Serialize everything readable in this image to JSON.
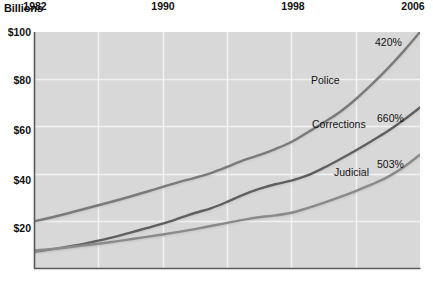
{
  "chart_data": {
    "type": "line",
    "title": "Billions",
    "xlabel": "",
    "ylabel": "Billions",
    "grid": true,
    "legend_position": "inline-labels",
    "xlim": [
      1982,
      2006
    ],
    "ylim": [
      0,
      100
    ],
    "x_ticks": [
      {
        "value": 1982,
        "label": "1982"
      },
      {
        "value": 1990,
        "label": "1990"
      },
      {
        "value": 1998,
        "label": "1998"
      },
      {
        "value": 2006,
        "label": "2006"
      }
    ],
    "y_ticks": [
      {
        "value": 20,
        "label": "$20"
      },
      {
        "value": 40,
        "label": "$40"
      },
      {
        "value": 60,
        "label": "$60"
      },
      {
        "value": 80,
        "label": "$80"
      },
      {
        "value": 100,
        "label": "$100"
      }
    ],
    "x": [
      1982,
      1983,
      1984,
      1985,
      1986,
      1987,
      1988,
      1989,
      1990,
      1991,
      1992,
      1993,
      1994,
      1995,
      1996,
      1997,
      1998,
      1999,
      2000,
      2001,
      2002,
      2003,
      2004,
      2005,
      2006
    ],
    "series": [
      {
        "name": "Police",
        "annotation": "420%",
        "color": "#7a7a7a",
        "values": [
          19.8,
          21.3,
          23.0,
          24.8,
          26.6,
          28.4,
          30.3,
          32.3,
          34.4,
          36.4,
          38.2,
          40.2,
          42.8,
          45.6,
          47.8,
          50.4,
          53.4,
          57.4,
          61.6,
          66.0,
          71.5,
          77.8,
          84.6,
          92.0,
          100.0
        ]
      },
      {
        "name": "Corrections",
        "annotation": "660%",
        "color": "#5e5e5e",
        "values": [
          6.9,
          7.8,
          8.9,
          10.1,
          11.6,
          13.2,
          15.0,
          16.9,
          18.8,
          21.0,
          23.3,
          25.3,
          28.0,
          31.0,
          33.5,
          35.5,
          37.0,
          39.2,
          42.4,
          46.0,
          49.8,
          53.8,
          58.0,
          62.8,
          68.0
        ]
      },
      {
        "name": "Judicial",
        "annotation": "503%",
        "color": "#8a8a8a",
        "values": [
          7.4,
          8.0,
          8.7,
          9.5,
          10.3,
          11.2,
          12.2,
          13.2,
          14.2,
          15.3,
          16.5,
          17.8,
          19.1,
          20.4,
          21.5,
          22.3,
          23.4,
          25.4,
          27.6,
          30.0,
          32.6,
          35.4,
          38.6,
          42.8,
          48.0
        ]
      }
    ]
  },
  "plot": {
    "background_color": "#d8d8d8",
    "gridline_color": "#f2f2f2",
    "axis_color": "#595959",
    "text_color": "#111111"
  },
  "labels": {
    "police": "Police",
    "corrections": "Corrections",
    "judicial": "Judicial",
    "police_pct": "420%",
    "corrections_pct": "660%",
    "judicial_pct": "503%",
    "y_100": "$100",
    "y_80": "$80",
    "y_60": "$60",
    "y_40": "$40",
    "y_20": "$20",
    "x_1982": "1982",
    "x_1990": "1990",
    "x_1998": "1998",
    "x_2006": "2006"
  }
}
